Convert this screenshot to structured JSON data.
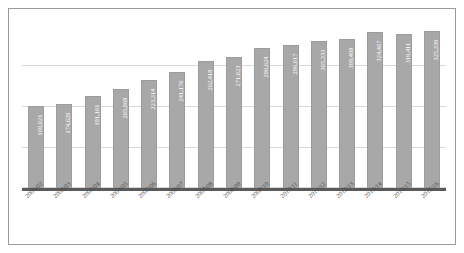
{
  "chart_data": {
    "type": "bar",
    "title": "",
    "xlabel": "",
    "ylabel": "",
    "grid": true,
    "legend": false,
    "ylim": [
      0,
      340000
    ],
    "categories": [
      "2001/02",
      "2002/03",
      "2003/04",
      "2004/05",
      "2005/06",
      "2006/07",
      "2007/08",
      "2008/09",
      "2009/10",
      "2010/11",
      "2011/12",
      "2012/13",
      "2013/14",
      "2014/15",
      "2015/16"
    ],
    "values": [
      169021,
      174629,
      191161,
      205968,
      223314,
      241176,
      262418,
      271023,
      290624,
      296617,
      305333,
      308408,
      324467,
      319411,
      325339
    ],
    "value_labels": [
      "169,021",
      "174,629",
      "191,161",
      "205,968",
      "223,314",
      "241,176",
      "262,418",
      "271,023",
      "290,624",
      "296,617",
      "305,333",
      "308,408",
      "324,467",
      "319,411",
      "325,339"
    ]
  },
  "style": {
    "bar_color": "#a8a8a8",
    "bar_edge_color": "#9c9c9c",
    "gridline_color": "#d8d8d8",
    "axis_color": "#5a5a5a",
    "frame_color": "#9a9a9a",
    "value_label_color": "#ffffff",
    "category_label_color": "#4a4a4a",
    "background": "#ffffff"
  }
}
